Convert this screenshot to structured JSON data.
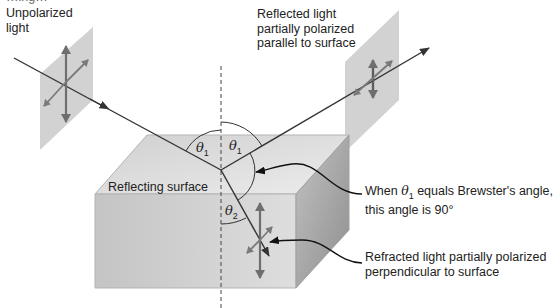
{
  "diagram": {
    "cut_off_top_text": "…ing…",
    "labels": {
      "unpolarized_line1": "Unpolarized",
      "unpolarized_line2": "light",
      "reflected_line1": "Reflected light",
      "reflected_line2": "partially polarized",
      "reflected_line3": "parallel to surface",
      "reflecting_surface": "Reflecting surface",
      "brewster_prefix": "When ",
      "brewster_symbol": "θ",
      "brewster_sub": "1",
      "brewster_suffix": " equals Brewster's angle,",
      "brewster_line2": "this angle is 90°",
      "refracted_line1": "Refracted light partially polarized",
      "refracted_line2": "perpendicular to surface"
    },
    "angles": {
      "incident": {
        "symbol": "θ",
        "sub": "1"
      },
      "reflected": {
        "symbol": "θ",
        "sub": "1"
      },
      "refracted": {
        "symbol": "θ",
        "sub": "2"
      }
    },
    "colors": {
      "plane": "#c8c8c8",
      "box_top": "#dcdcdc",
      "box_front": "#cfcfcf",
      "box_side": "#a9a9a9",
      "arrow": "#6e6e6e",
      "ray": "#333333"
    }
  }
}
